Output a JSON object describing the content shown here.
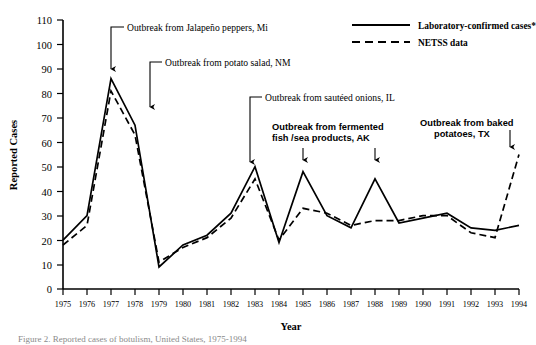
{
  "chart_data": {
    "type": "line",
    "title": "",
    "xlabel": "Year",
    "ylabel": "Reported Cases",
    "xlim": [
      1975,
      1994
    ],
    "ylim": [
      0,
      110
    ],
    "ytick_step": 10,
    "grid": false,
    "legend_position": "top-right",
    "x": [
      1975,
      1976,
      1977,
      1978,
      1979,
      1980,
      1981,
      1982,
      1983,
      1984,
      1985,
      1986,
      1987,
      1988,
      1989,
      1990,
      1991,
      1992,
      1993,
      1994
    ],
    "xticklabels": [
      "1975",
      "1976",
      "1977",
      "1978",
      "1979",
      "1980",
      "1981",
      "1982",
      "1983",
      "1984",
      "1985",
      "1986",
      "1987",
      "1988",
      "1989",
      "1990",
      "1991",
      "1992",
      "1993",
      "1994"
    ],
    "yticklabels": [
      "0",
      "10",
      "20",
      "30",
      "40",
      "50",
      "60",
      "70",
      "80",
      "90",
      "100",
      "110"
    ],
    "series": [
      {
        "name": "Laboratory-confirmed cases*",
        "style": "solid",
        "values": [
          20,
          30,
          86,
          67,
          9,
          18,
          22,
          31,
          50,
          19,
          48,
          30,
          25,
          45,
          27,
          29,
          31,
          25,
          24,
          26
        ]
      },
      {
        "name": "NETSS data",
        "style": "dashed",
        "values": [
          18,
          26,
          81,
          63,
          11,
          17,
          21,
          29,
          45,
          20,
          33,
          31,
          26,
          28,
          28,
          30,
          30,
          23,
          21,
          55
        ]
      }
    ],
    "annotations": [
      {
        "id": "jalapeno",
        "text": "Outbreak from Jalapeño peppers, Mi",
        "points_to_year": 1977
      },
      {
        "id": "potato-salad",
        "text": "Outbreak from potato salad, NM",
        "points_to_year": 1978
      },
      {
        "id": "sauteed-onions",
        "text": "Outbreak from sautéed onions, IL",
        "points_to_year": 1983
      },
      {
        "id": "fermented-fish",
        "text_line1": "Outbreak from fermented",
        "text_line2": "fish /sea products, AK",
        "points_to_year": [
          1985,
          1988
        ]
      },
      {
        "id": "baked-potatoes",
        "text_line1": "Outbreak from baked",
        "text_line2": "potatoes, TX",
        "points_to_year": 1994
      }
    ]
  },
  "legend": {
    "items": [
      {
        "label": "Laboratory-confirmed cases*",
        "style": "solid"
      },
      {
        "label": "NETSS data",
        "style": "dashed"
      }
    ]
  },
  "axis": {
    "x_title": "Year",
    "y_title": "Reported Cases"
  },
  "caption": {
    "text": "Figure 2. Reported cases of botulism, United States, 1975-1994"
  }
}
